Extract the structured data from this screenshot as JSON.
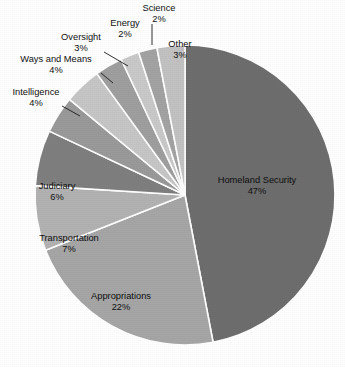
{
  "chart_data": {
    "type": "pie",
    "title": "",
    "subtitle": "",
    "xlabel": "",
    "ylabel": "",
    "grid": false,
    "legend_position": "none",
    "label_format": "name above percent",
    "total_percent": 100,
    "units": "percent",
    "categories": [
      "Homeland Security",
      "Appropriations",
      "Transportation",
      "Judiciary",
      "Intelligence",
      "Ways and Means",
      "Oversight",
      "Energy",
      "Science",
      "Other"
    ],
    "values": [
      47,
      22,
      7,
      6,
      4,
      4,
      3,
      2,
      2,
      3
    ],
    "slices": [
      {
        "label": "Homeland Security",
        "value": 47,
        "value_text": "47%",
        "color": "#6e6e6e",
        "label_placement": "inside",
        "label_x": 257,
        "label_y": 183,
        "label_anchor": "middle",
        "leader": false
      },
      {
        "label": "Appropriations",
        "value": 22,
        "value_text": "22%",
        "color": "#a6a6a6",
        "label_placement": "inside",
        "label_x": 121,
        "label_y": 299,
        "label_anchor": "middle",
        "leader": false
      },
      {
        "label": "Transportation",
        "value": 7,
        "value_text": "7%",
        "color": "#b2b2b2",
        "label_placement": "inside",
        "label_x": 69,
        "label_y": 241,
        "label_anchor": "middle",
        "leader": false
      },
      {
        "label": "Judiciary",
        "value": 6,
        "value_text": "6%",
        "color": "#7f7f7f",
        "label_placement": "inside",
        "label_x": 57,
        "label_y": 189,
        "label_anchor": "middle",
        "leader": false
      },
      {
        "label": "Intelligence",
        "value": 4,
        "value_text": "4%",
        "color": "#9a9a9a",
        "label_placement": "outside",
        "label_x": 36,
        "label_y": 95,
        "label_anchor": "middle",
        "leader": true,
        "leader_points": "62,106 80,116"
      },
      {
        "label": "Ways and Means",
        "value": 4,
        "value_text": "4%",
        "color": "#c6c6c6",
        "label_placement": "outside",
        "label_x": 56,
        "label_y": 62,
        "label_anchor": "middle",
        "leader": true,
        "leader_points": "101,73 113,83"
      },
      {
        "label": "Oversight",
        "value": 3,
        "value_text": "3%",
        "color": "#9f9f9f",
        "label_placement": "outside",
        "label_x": 81,
        "label_y": 40,
        "label_anchor": "middle",
        "leader": true,
        "leader_points": "104,52 128,66"
      },
      {
        "label": "Energy",
        "value": 2,
        "value_text": "2%",
        "color": "#c9c9c9",
        "label_placement": "outside",
        "label_x": 125,
        "label_y": 26,
        "label_anchor": "middle",
        "leader": false
      },
      {
        "label": "Science",
        "value": 2,
        "value_text": "2%",
        "color": "#a3a3a3",
        "label_placement": "outside",
        "label_x": 159,
        "label_y": 11,
        "label_anchor": "middle",
        "leader": true,
        "leader_points": "152,24 152,45"
      },
      {
        "label": "Other",
        "value": 3,
        "value_text": "3%",
        "color": "#c2c2c2",
        "label_placement": "inside",
        "label_y": 47,
        "label_x": 180,
        "label_anchor": "middle",
        "leader": false
      }
    ],
    "geometry": {
      "center_x": 185,
      "center_y": 195,
      "radius": 150,
      "start_angle_deg": -90,
      "direction": "clockwise"
    }
  }
}
